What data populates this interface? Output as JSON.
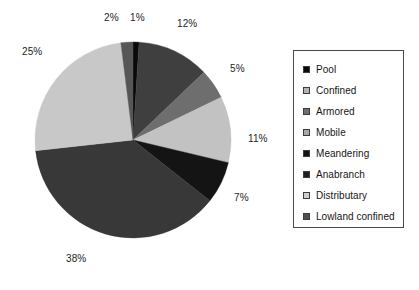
{
  "chart_data": {
    "type": "pie",
    "title": "",
    "subtitle": "",
    "xlabel": "",
    "ylabel": "",
    "legend_position": "right",
    "grid": false,
    "start_angle_deg": 0,
    "direction": "clockwise",
    "units": "percent",
    "categories": [
      "Pool",
      "Confined",
      "Armored",
      "Mobile",
      "Meandering",
      "Anabranch",
      "Distributary",
      "Lowland confined"
    ],
    "values": [
      1,
      12,
      5,
      11,
      7,
      38,
      25,
      2
    ],
    "colors": [
      "#0a0a0a",
      "#3f3f3f",
      "#6e6e6e",
      "#c2c2c2",
      "#141414",
      "#383838",
      "#c8c8c8",
      "#565656"
    ],
    "slices": [
      {
        "label": "Pool",
        "value": 1,
        "display": "1%",
        "color": "#0a0a0a"
      },
      {
        "label": "Confined",
        "value": 12,
        "display": "12%",
        "color": "#3f3f3f"
      },
      {
        "label": "Armored",
        "value": 5,
        "display": "5%",
        "color": "#6e6e6e"
      },
      {
        "label": "Mobile",
        "value": 11,
        "display": "11%",
        "color": "#c2c2c2"
      },
      {
        "label": "Meandering",
        "value": 7,
        "display": "7%",
        "color": "#141414"
      },
      {
        "label": "Anabranch",
        "value": 38,
        "display": "38%",
        "color": "#383838"
      },
      {
        "label": "Distributary",
        "value": 25,
        "display": "25%",
        "color": "#c8c8c8"
      },
      {
        "label": "Lowland confined",
        "value": 2,
        "display": "2%",
        "color": "#565656"
      }
    ]
  },
  "labels": {
    "pool": "1%",
    "confined": "12%",
    "armored": "5%",
    "mobile": "11%",
    "meandering": "7%",
    "anabranch": "38%",
    "distributary": "25%",
    "lowland_confined": "2%"
  },
  "legend": {
    "items": [
      {
        "label": "Pool",
        "color": "#0a0a0a"
      },
      {
        "label": "Confined",
        "color": "#b4b4b4"
      },
      {
        "label": "Armored",
        "color": "#6e6e6e"
      },
      {
        "label": "Mobile",
        "color": "#a8a8a8"
      },
      {
        "label": "Meandering",
        "color": "#141414"
      },
      {
        "label": "Anabranch",
        "color": "#1f1f1f"
      },
      {
        "label": "Distributary",
        "color": "#cfcfcf"
      },
      {
        "label": "Lowland confined",
        "color": "#4f4f4f"
      }
    ]
  }
}
